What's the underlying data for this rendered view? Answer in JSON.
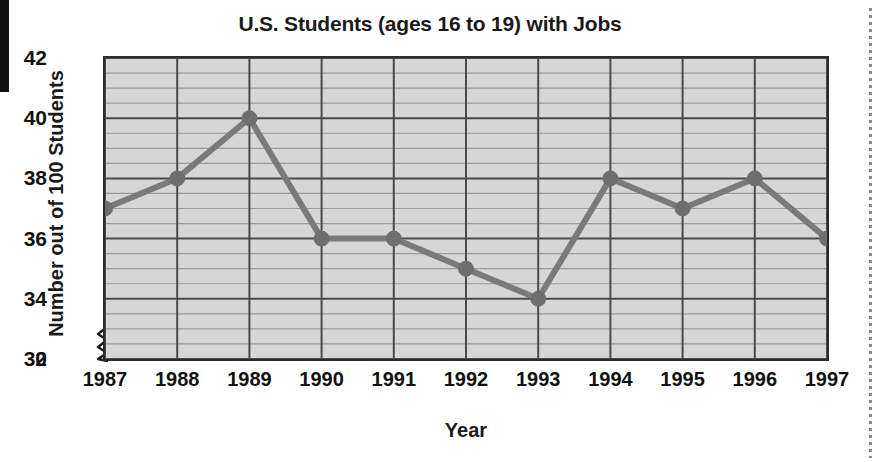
{
  "chart_data": {
    "type": "line",
    "title": "U.S. Students (ages 16 to 19) with Jobs",
    "xlabel": "Year",
    "ylabel": "Number out of 100 Students",
    "categories": [
      "1987",
      "1988",
      "1989",
      "1990",
      "1991",
      "1992",
      "1993",
      "1994",
      "1995",
      "1996",
      "1997"
    ],
    "values": [
      37,
      38,
      40,
      36,
      36,
      35,
      34,
      38,
      37,
      38,
      36
    ],
    "series": [
      {
        "name": "Number out of 100 Students",
        "values": [
          37,
          38,
          40,
          36,
          36,
          35,
          34,
          38,
          37,
          38,
          36
        ]
      }
    ],
    "ylim": [
      32,
      42
    ],
    "y_ticks": [
      32,
      34,
      36,
      38,
      40,
      42
    ],
    "y_tick_labels": [
      "32",
      "34",
      "36",
      "38",
      "40",
      "42"
    ],
    "y_axis_origin_label": "0",
    "y_axis_break": true,
    "y_minor_step": 0.5,
    "grid": true,
    "legend": "none",
    "marker": "circle",
    "colors": {
      "line": "#7a7a7a",
      "marker": "#6e6e6e",
      "plot_background": "#d6d6d6",
      "major_gridline": "#4a4a4a",
      "minor_gridline": "#9a9a9a",
      "axis": "#2b2b2b",
      "text": "#121212"
    }
  },
  "page": {
    "title": "U.S. Students (ages 16 to 19) with Jobs",
    "x_axis_title": "Year",
    "y_axis_title": "Number out of 100 Students",
    "zero_label": "0"
  }
}
